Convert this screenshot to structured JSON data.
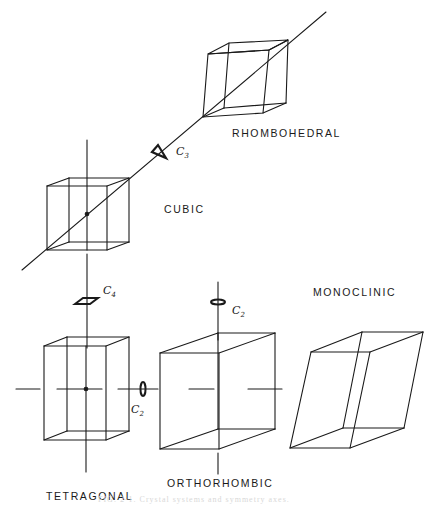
{
  "diagram": {
    "systems": [
      {
        "id": "rhombohedral",
        "label": "RHOMBOHEDRAL"
      },
      {
        "id": "cubic",
        "label": "CUBIC"
      },
      {
        "id": "tetragonal",
        "label": "TETRAGONAL"
      },
      {
        "id": "orthorhombic",
        "label": "ORTHORHOMBIC"
      },
      {
        "id": "monoclinic",
        "label": "MONOCLINIC"
      }
    ],
    "axes": [
      {
        "id": "c3",
        "symbol": "C",
        "order": "3",
        "shape": "triangle"
      },
      {
        "id": "c4",
        "symbol": "C",
        "order": "4",
        "shape": "square"
      },
      {
        "id": "c2_vertical",
        "symbol": "C",
        "order": "2",
        "shape": "ellipse"
      },
      {
        "id": "c2_horizontal",
        "symbol": "C",
        "order": "2",
        "shape": "ellipse"
      }
    ],
    "caption": "FIG. 2-1. Crystal systems and symmetry axes."
  },
  "colors": {
    "line": "#1a1a1a",
    "background": "#ffffff"
  }
}
